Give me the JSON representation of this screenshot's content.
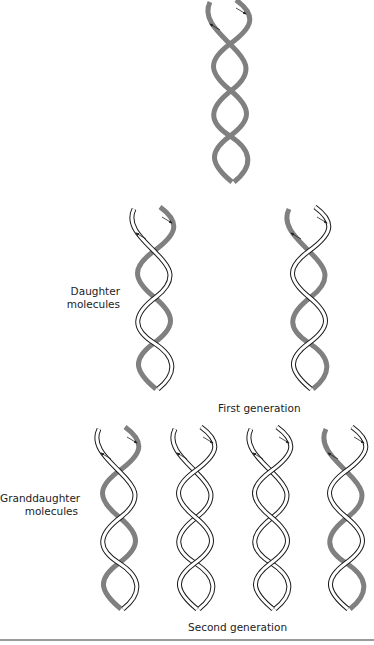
{
  "figure": {
    "parent": {
      "label": "",
      "strands": [
        "old",
        "old"
      ]
    },
    "daughters": {
      "label_line1": "Daughter",
      "label_line2": "molecules",
      "molecules": [
        {
          "strands": [
            "old",
            "new"
          ]
        },
        {
          "strands": [
            "new",
            "old"
          ]
        }
      ]
    },
    "first_generation_label": "First generation",
    "granddaughters": {
      "label_line1": "Granddaughter",
      "label_line2": "molecules",
      "molecules": [
        {
          "strands": [
            "old",
            "new"
          ]
        },
        {
          "strands": [
            "new",
            "new"
          ]
        },
        {
          "strands": [
            "new",
            "new"
          ]
        },
        {
          "strands": [
            "new",
            "old"
          ]
        }
      ]
    },
    "second_generation_label": "Second generation",
    "colors": {
      "old_strand": "#808080",
      "new_strand_outline": "#1a1a1a",
      "new_strand_fill": "#ffffff"
    }
  }
}
